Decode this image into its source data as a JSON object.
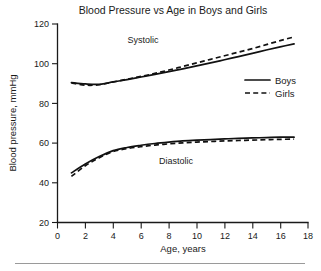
{
  "chart_data": {
    "type": "line",
    "title": "Blood Pressure vs Age in Boys and Girls",
    "xlabel": "Age, years",
    "ylabel": "Blood pressure, mmHg",
    "xlim": [
      0,
      18
    ],
    "ylim": [
      20,
      120
    ],
    "xticks": [
      0,
      2,
      4,
      6,
      8,
      10,
      12,
      14,
      16,
      18
    ],
    "yticks": [
      20,
      40,
      60,
      80,
      100,
      120
    ],
    "xtick_labels": [
      "0",
      "2",
      "4",
      "6",
      "8",
      "10",
      "12",
      "14",
      "16",
      "18"
    ],
    "ytick_labels": [
      "20",
      "40",
      "60",
      "80",
      "100",
      "120"
    ],
    "grid": false,
    "legend_position": "center-right",
    "legend": [
      {
        "name": "Boys",
        "style": "solid"
      },
      {
        "name": "Girls",
        "style": "dashed"
      }
    ],
    "annotations": [
      {
        "text": "Systolic",
        "x": 6.2,
        "y": 110
      },
      {
        "text": "Diastolic",
        "x": 10.3,
        "y": 52
      }
    ],
    "x": [
      1,
      2,
      3,
      4,
      5,
      6,
      7,
      8,
      9,
      10,
      11,
      12,
      13,
      14,
      15,
      16,
      17
    ],
    "series": [
      {
        "name": "Boys",
        "measure": "Systolic",
        "style": "solid",
        "values": [
          90.5,
          89.8,
          89.6,
          90.8,
          92.0,
          93.3,
          94.6,
          96.0,
          97.4,
          98.9,
          100.4,
          102.0,
          103.6,
          105.2,
          106.9,
          108.5,
          110.0
        ]
      },
      {
        "name": "Girls",
        "measure": "Systolic",
        "style": "dashed",
        "values": [
          90.3,
          89.2,
          89.4,
          90.8,
          92.2,
          93.6,
          95.1,
          96.8,
          98.6,
          100.4,
          102.2,
          104.0,
          105.8,
          107.6,
          109.6,
          111.6,
          113.5
        ]
      },
      {
        "name": "Boys",
        "measure": "Diastolic",
        "style": "solid",
        "values": [
          45.0,
          49.5,
          53.2,
          56.2,
          57.8,
          58.9,
          59.8,
          60.5,
          61.1,
          61.5,
          61.8,
          62.1,
          62.4,
          62.6,
          62.8,
          63.0,
          63.0
        ]
      },
      {
        "name": "Girls",
        "measure": "Diastolic",
        "style": "dashed",
        "values": [
          43.2,
          48.6,
          52.6,
          55.8,
          57.2,
          58.2,
          59.0,
          59.6,
          60.1,
          60.5,
          60.8,
          61.1,
          61.3,
          61.5,
          61.7,
          61.9,
          62.0
        ]
      }
    ],
    "colors": {
      "line": "#111111",
      "axis": "#1a1a1a",
      "background": "#ffffff",
      "footer_rule": "#9a9a9a"
    }
  }
}
